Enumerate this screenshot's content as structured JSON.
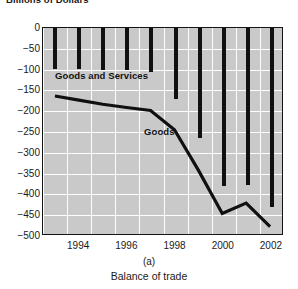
{
  "chart_data": {
    "type": "bar",
    "title": "Billions of Dollars",
    "xlabel": "",
    "ylabel": "Billions of Dollars",
    "ylim": [
      -500,
      0
    ],
    "xlim": [
      1992.5,
      2002.5
    ],
    "grid": true,
    "legend_position": "inline-annotation",
    "yticks": [
      0,
      -50,
      -100,
      -150,
      -200,
      -250,
      -300,
      -350,
      -400,
      -450,
      -500
    ],
    "ytick_labels": [
      "0",
      "−50",
      "−100",
      "−150",
      "−200",
      "−250",
      "−300",
      "−350",
      "−400",
      "−450",
      "−500"
    ],
    "xticks": [
      1994,
      1996,
      1998,
      2000,
      2002
    ],
    "xtick_labels": [
      "1994",
      "1996",
      "1998",
      "2000",
      "2002"
    ],
    "x": [
      1993,
      1994,
      1995,
      1996,
      1997,
      1998,
      1999,
      2000,
      2001,
      2002
    ],
    "series": [
      {
        "name": "Goods and Services",
        "type": "bar",
        "values": [
          -98,
          -98,
          -100,
          -100,
          -105,
          -170,
          -265,
          -380,
          -378,
          -430
        ]
      },
      {
        "name": "Goods",
        "type": "line",
        "values": [
          -165,
          -175,
          -185,
          -193,
          -200,
          -247,
          -345,
          -450,
          -425,
          -482
        ]
      }
    ],
    "annotations": [
      {
        "text": "Goods and Services",
        "x": 1993.5,
        "y": -128
      },
      {
        "text": "Goods",
        "x": 1997.3,
        "y": -268
      }
    ]
  },
  "captions": {
    "panel_label": "(a)",
    "subtitle": "Balance of trade"
  }
}
